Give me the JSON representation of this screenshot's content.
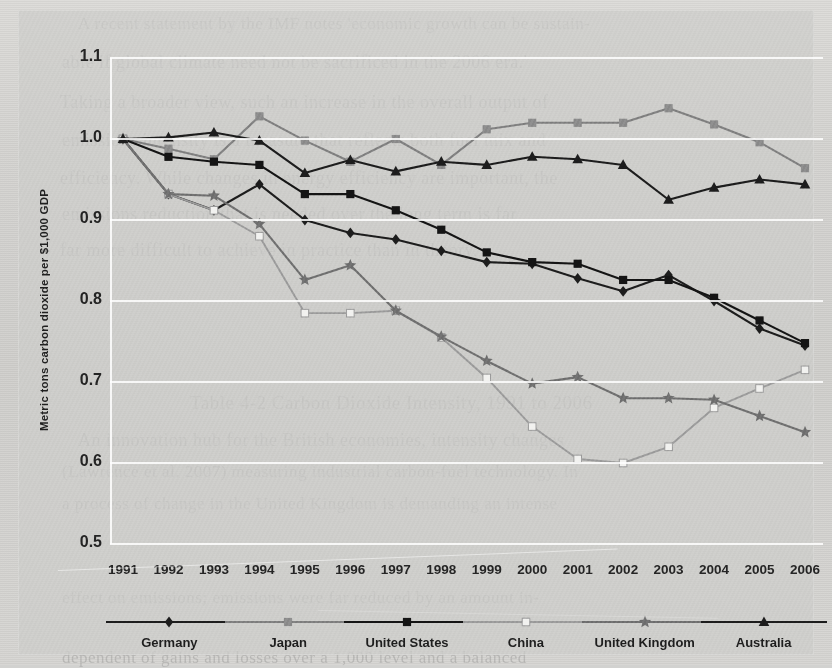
{
  "chart_data": {
    "type": "line",
    "title": "",
    "xlabel": "",
    "ylabel": "Metric tons carbon dioxide per $1,000 GDP",
    "categories": [
      "1991",
      "1992",
      "1993",
      "1994",
      "1995",
      "1996",
      "1997",
      "1998",
      "1999",
      "2000",
      "2001",
      "2002",
      "2003",
      "2004",
      "2005",
      "2006"
    ],
    "x": [
      1991,
      1992,
      1993,
      1994,
      1995,
      1996,
      1997,
      1998,
      1999,
      2000,
      2001,
      2002,
      2003,
      2004,
      2005,
      2006
    ],
    "ylim": [
      0.5,
      1.1
    ],
    "yticks": [
      "1.1",
      "1.0",
      "0.9",
      "0.8",
      "0.7",
      "0.6",
      "0.5"
    ],
    "ytick_values": [
      1.1,
      1.0,
      0.9,
      0.8,
      0.7,
      0.6,
      0.5
    ],
    "grid": true,
    "legend_position": "bottom",
    "series": [
      {
        "name": "Germany",
        "marker": "diamond",
        "color": "#1c1c1c",
        "values": [
          1.0,
          0.932,
          0.912,
          0.944,
          0.9,
          0.884,
          0.876,
          0.862,
          0.848,
          0.846,
          0.828,
          0.812,
          0.832,
          0.8,
          0.766,
          0.745
        ]
      },
      {
        "name": "Japan",
        "marker": "square-gray",
        "color": "#7e7e7e",
        "values": [
          1.0,
          0.988,
          0.975,
          1.028,
          0.998,
          0.972,
          1.0,
          0.968,
          1.012,
          1.02,
          1.02,
          1.02,
          1.038,
          1.018,
          0.996,
          0.964
        ]
      },
      {
        "name": "United States",
        "marker": "square-black",
        "color": "#141414",
        "values": [
          1.0,
          0.978,
          0.972,
          0.968,
          0.932,
          0.932,
          0.912,
          0.888,
          0.86,
          0.848,
          0.846,
          0.826,
          0.826,
          0.804,
          0.776,
          0.748
        ]
      },
      {
        "name": "China",
        "marker": "square-white",
        "color": "#9a9a9a",
        "values": [
          1.0,
          0.932,
          0.912,
          0.88,
          0.785,
          0.785,
          0.788,
          0.755,
          0.705,
          0.645,
          0.605,
          0.6,
          0.62,
          0.668,
          0.692,
          0.715
        ]
      },
      {
        "name": "United Kingdom",
        "marker": "star-gray",
        "color": "#6e6e6e",
        "values": [
          1.0,
          0.932,
          0.93,
          0.895,
          0.826,
          0.844,
          0.788,
          0.756,
          0.726,
          0.698,
          0.706,
          0.68,
          0.68,
          0.678,
          0.658,
          0.638
        ]
      },
      {
        "name": "Australia",
        "marker": "triangle",
        "color": "#1c1c1c",
        "values": [
          1.0,
          1.002,
          1.008,
          0.998,
          0.958,
          0.974,
          0.96,
          0.972,
          0.968,
          0.978,
          0.975,
          0.968,
          0.925,
          0.94,
          0.95,
          0.944
        ]
      }
    ]
  },
  "legend": {
    "items": [
      {
        "label": "Germany",
        "marker": "diamond",
        "color": "#1c1c1c"
      },
      {
        "label": "Japan",
        "marker": "square-gray",
        "color": "#7e7e7e"
      },
      {
        "label": "United States",
        "marker": "square-black",
        "color": "#141414"
      },
      {
        "label": "China",
        "marker": "square-white",
        "color": "#9a9a9a"
      },
      {
        "label": "United Kingdom",
        "marker": "star-gray",
        "color": "#6e6e6e"
      },
      {
        "label": "Australia",
        "marker": "triangle",
        "color": "#1c1c1c"
      }
    ]
  },
  "page_background": {
    "ghost_lines": [
      {
        "text": "A recent statement by the IMF notes 'economic growth can be sustain-",
        "x": 78,
        "y": 14,
        "size": 17
      },
      {
        "text": "able if global climate need not be sacrificed in the 2006 era.'",
        "x": 62,
        "y": 52,
        "size": 18
      },
      {
        "text": "Taking a broader view, such an increase in the overall output of",
        "x": 60,
        "y": 92,
        "size": 18
      },
      {
        "text": "emissions intensity is a measure that reflects both fuel mix and",
        "x": 62,
        "y": 130,
        "size": 18
      },
      {
        "text": "efficiency. While changes in energy efficiency are important, the",
        "x": 60,
        "y": 168,
        "size": 18
      },
      {
        "text": "emissions reduction that is needed over the long term is far",
        "x": 62,
        "y": 204,
        "size": 18
      },
      {
        "text": "far more difficult to achieve in practice than in theory.",
        "x": 60,
        "y": 240,
        "size": 18
      },
      {
        "text": "Table 4-2    Carbon Dioxide Intensity, 1991 to 2006",
        "x": 190,
        "y": 392,
        "size": 19
      },
      {
        "text": "An innovation hub for the British economies, intensity changes",
        "x": 78,
        "y": 430,
        "size": 18
      },
      {
        "text": "(Lawrence et al. 2007) measuring industrial carbon-fuel technology. In",
        "x": 62,
        "y": 462,
        "size": 17
      },
      {
        "text": "a process of change in the United Kingdom is demanding an intense",
        "x": 62,
        "y": 494,
        "size": 17
      },
      {
        "text": "effect on emissions; emissions were far reduced by an amount in-",
        "x": 62,
        "y": 588,
        "size": 17
      },
      {
        "text": "dependent of gains and losses over a 1,000 level and a balanced",
        "x": 62,
        "y": 648,
        "size": 17
      }
    ]
  }
}
